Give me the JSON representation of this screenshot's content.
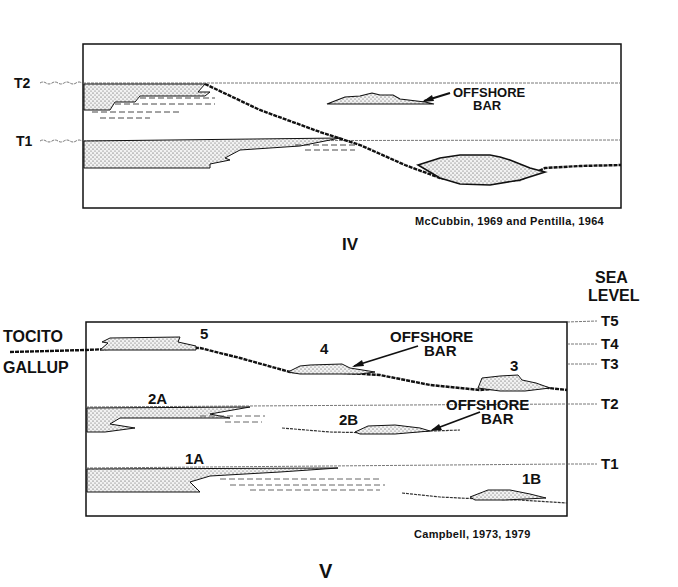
{
  "panel_iv": {
    "roman_numeral": "IV",
    "citation": "McCubbin, 1969 and Pentilla, 1964",
    "time_lines": [
      {
        "label": "T2"
      },
      {
        "label": "T1"
      }
    ],
    "annotation": {
      "line1": "OFFSHORE",
      "line2": "BAR"
    }
  },
  "panel_v": {
    "roman_numeral": "V",
    "citation": "Campbell, 1973, 1979",
    "sea_level_title": {
      "line1": "SEA",
      "line2": "LEVEL"
    },
    "formations": {
      "upper": "TOCITO",
      "lower": "GALLUP"
    },
    "time_lines": [
      {
        "label": "T5"
      },
      {
        "label": "T4"
      },
      {
        "label": "T3"
      },
      {
        "label": "T2"
      },
      {
        "label": "T1"
      }
    ],
    "sand_bodies": [
      {
        "label": "5"
      },
      {
        "label": "4"
      },
      {
        "label": "3"
      },
      {
        "label": "2A"
      },
      {
        "label": "2B"
      },
      {
        "label": "1A"
      },
      {
        "label": "1B"
      }
    ],
    "annotations": [
      {
        "line1": "OFFSHORE",
        "line2": "BAR"
      },
      {
        "line1": "OFFSHORE",
        "line2": "BAR"
      }
    ]
  }
}
